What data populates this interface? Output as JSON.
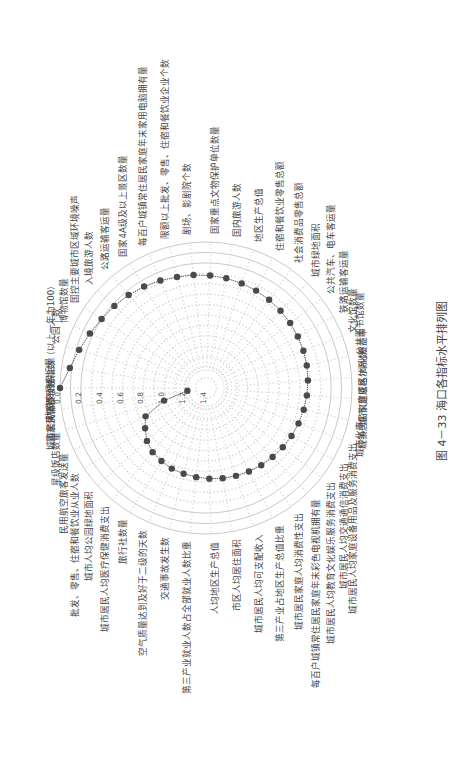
{
  "page": {
    "caption": "图 4－33   海口各指标水平排列图",
    "rotation_deg": -90
  },
  "chart_data": {
    "type": "radar",
    "title": "海口各指标水平排列图",
    "figure_number": "图 4－33",
    "radial_axis": {
      "reversed": true,
      "range": [
        0.0,
        1.4
      ],
      "ticks": [
        "0.0",
        "0.2",
        "0.4",
        "0.6",
        "0.8",
        "1.0",
        "1.2",
        "1.4"
      ],
      "grid": "dotted"
    },
    "series": [
      {
        "name": "海口",
        "color": "#444444",
        "marker": "circle"
      }
    ],
    "categories": [
      "轨道交通客运量",
      "城市居民消费价格指数（以上一年为100）",
      "公园个数",
      "博物馆数量",
      "国控主要城市区域环境噪声",
      "入境旅游人数",
      "公路运输客运量",
      "国家4A级及以上景区数量",
      "每百户城镇常住居民家庭年末家用电脑拥有量",
      "限额以上批发、零售、住宿和餐饮业企业个数",
      "剧场、影剧院个数",
      "国家重点文物保护单位数量",
      "国内旅游人数",
      "地区生产总值",
      "住宿和餐饮业零售总额",
      "社会消费品零售总额",
      "城市绿地面积",
      "公共汽车、电车客运量",
      "铁路运输客运量",
      "文化馆数量",
      "公共图书馆数量",
      "城市(建成区)绿化覆盖率",
      "城镇居民家庭恩格尔系数",
      "城市化率",
      "城市居民人均家庭设备用品及服务消费支出",
      "城市居民人均交通通信消费支出",
      "城市居民人均教育文化娱乐服务消费支出",
      "每百户城镇常住居民家庭年末彩色电视机拥有量",
      "城市居民家庭人均消费性支出",
      "第三产业占地区生产总值比重",
      "城市居民人均可支配收入",
      "市区人均居住面积",
      "人均地区生产总值",
      "第三产业就业人数占全部就业人数比重",
      "交通事故发生数",
      "空气质量达到及好于二级的天数",
      "旅行社数量",
      "城市居民人均医疗保健消费支出",
      "城市人均公园绿地面积",
      "批发、零售、住宿和餐饮业从业人数",
      "民用航空旅客发送量",
      "星级饭店数量",
      "国家荣誉称号数"
    ],
    "values": [
      0.0,
      0.08,
      0.13,
      0.17,
      0.2,
      0.22,
      0.24,
      0.26,
      0.28,
      0.3,
      0.31,
      0.32,
      0.33,
      0.34,
      0.35,
      0.36,
      0.37,
      0.38,
      0.39,
      0.4,
      0.41,
      0.42,
      0.43,
      0.44,
      0.45,
      0.46,
      0.47,
      0.48,
      0.49,
      0.5,
      0.51,
      0.52,
      0.53,
      0.54,
      0.55,
      0.56,
      0.58,
      0.6,
      0.64,
      0.7,
      0.76,
      0.98,
      1.22
    ]
  }
}
